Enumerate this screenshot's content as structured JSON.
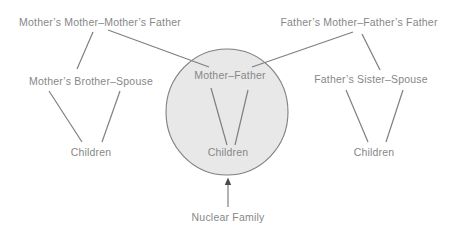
{
  "diagram": {
    "nodes": {
      "maternal_grandparents": {
        "label": "Mother’s Mother–Mother’s Father"
      },
      "paternal_grandparents": {
        "label": "Father’s Mother–Father’s Father"
      },
      "maternal_uncle_couple": {
        "label": "Mother’s Brother–Spouse"
      },
      "paternal_aunt_couple": {
        "label": "Father’s Sister–Spouse"
      },
      "parents": {
        "label": "Mother–Father"
      },
      "children_left": {
        "label": "Children"
      },
      "children_center": {
        "label": "Children"
      },
      "children_right": {
        "label": "Children"
      },
      "caption": {
        "label": "Nuclear Family"
      }
    },
    "edges": [
      {
        "from": "maternal_grandparents",
        "to": "maternal_uncle_couple"
      },
      {
        "from": "maternal_grandparents",
        "to": "parents"
      },
      {
        "from": "paternal_grandparents",
        "to": "parents"
      },
      {
        "from": "paternal_grandparents",
        "to": "paternal_aunt_couple"
      },
      {
        "from": "maternal_uncle_couple",
        "to": "children_left"
      },
      {
        "from": "maternal_uncle_couple",
        "to": "children_left"
      },
      {
        "from": "parents",
        "to": "children_center"
      },
      {
        "from": "parents",
        "to": "children_center"
      },
      {
        "from": "paternal_aunt_couple",
        "to": "children_right"
      },
      {
        "from": "paternal_aunt_couple",
        "to": "children_right"
      },
      {
        "from": "caption",
        "to": "nuclear_family_circle",
        "style": "arrow"
      }
    ],
    "colors": {
      "background": "#ffffff",
      "circle_fill": "#e8e8e8",
      "circle_stroke": "#7f7f7f",
      "line": "#7f7f7f",
      "text": "#878787",
      "arrowhead": "#4a4a4a"
    }
  }
}
